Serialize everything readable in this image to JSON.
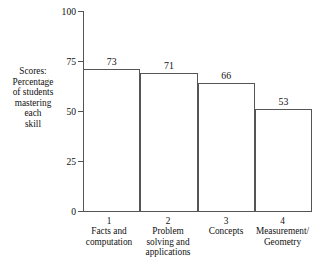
{
  "chart_data": {
    "type": "bar",
    "title": "",
    "subtitle": "",
    "xlabel": "",
    "ylabel": "Scores: Percentage of students mastering each skill",
    "ylim": [
      0,
      100
    ],
    "yticks": [
      0,
      25,
      50,
      75,
      100
    ],
    "ytick_labels": [
      "0",
      "25",
      "50",
      "75",
      "100"
    ],
    "grid": false,
    "legend": false,
    "legend_position": "none",
    "bar_style": "outlined-white",
    "categories": [
      "Facts and computation",
      "Problem solving and applications",
      "Concepts",
      "Measurement/ Geometry"
    ],
    "category_numbers": [
      "1",
      "2",
      "3",
      "4"
    ],
    "values": [
      73,
      71,
      66,
      53
    ],
    "value_labels": [
      "73",
      "71",
      "66",
      "53"
    ]
  },
  "axis": {
    "y_caption_lines": [
      "Scores:",
      "Percentage",
      "of students",
      "mastering",
      "each",
      "skill"
    ]
  },
  "categories": [
    {
      "number": "1",
      "line1": "Facts and",
      "line2": "computation",
      "line3": ""
    },
    {
      "number": "2",
      "line1": "Problem",
      "line2": "solving and",
      "line3": "applications"
    },
    {
      "number": "3",
      "line1": "Concepts",
      "line2": "",
      "line3": ""
    },
    {
      "number": "4",
      "line1": "Measurement/",
      "line2": "Geometry",
      "line3": ""
    }
  ],
  "bottom_caption": "",
  "colors": {
    "bar_fill": "#ffffff",
    "bar_stroke": "#555555",
    "axis": "#555555",
    "text": "#111111"
  }
}
